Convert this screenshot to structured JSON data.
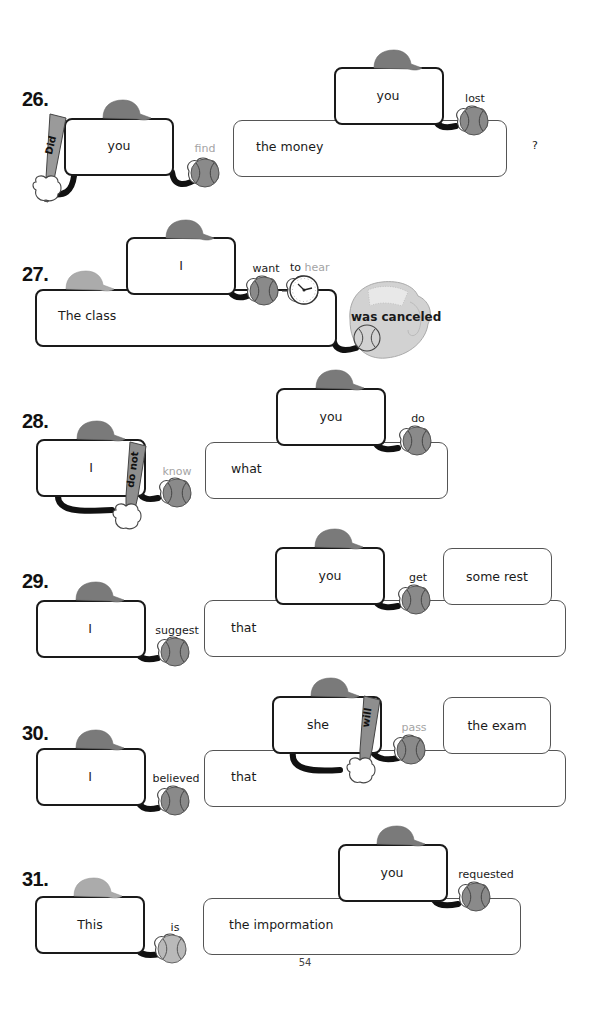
{
  "page_number": "54",
  "colors": {
    "cap_dark": "#7a7a7a",
    "cap_light": "#ababab",
    "ball_dark": "#8a8a8a",
    "ball_light": "#b9b9b9",
    "faded_text": "#a4a4a4"
  },
  "exercises": [
    {
      "number": "26.",
      "bat_word": "Did",
      "subject": "you",
      "verb": "find",
      "object": "the money",
      "clause_subject": "you",
      "clause_verb": "lost",
      "end_mark": "?"
    },
    {
      "number": "27.",
      "subject": "The class",
      "clause_subject": "I",
      "clause_verb": "want",
      "to_word": "to",
      "infinitive_verb": "hear",
      "main_verb": "was  canceled"
    },
    {
      "number": "28.",
      "subject": "I",
      "bat_word": "do not",
      "verb": "know",
      "object": "what",
      "clause_subject": "you",
      "clause_verb": "do"
    },
    {
      "number": "29.",
      "subject": "I",
      "verb": "suggest",
      "object": "that",
      "clause_subject": "you",
      "clause_verb": "get",
      "clause_object": "some rest"
    },
    {
      "number": "30.",
      "subject": "I",
      "verb": "believed",
      "object": "that",
      "clause_subject": "she",
      "bat_word": "will",
      "clause_verb": "pass",
      "clause_object": "the exam"
    },
    {
      "number": "31.",
      "subject": "This",
      "verb": "is",
      "object": "the impormation",
      "clause_subject": "you",
      "clause_verb": "requested"
    }
  ]
}
